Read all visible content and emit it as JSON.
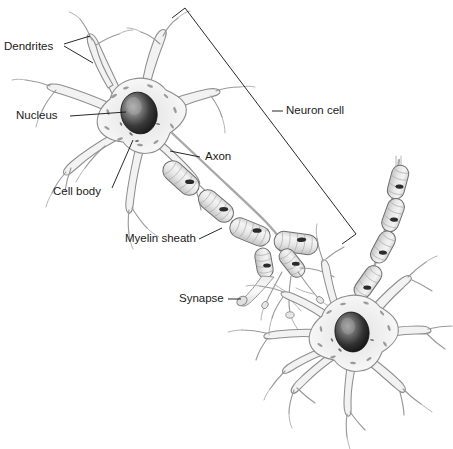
{
  "figure": {
    "background_color": "#ffffff",
    "width": 453,
    "height": 449,
    "style": "grayscale pencil/airbrush scientific illustration"
  },
  "labels": {
    "dendrites": "Dendrites",
    "nucleus": "Nucleus",
    "cell_body": "Cell body",
    "axon": "Axon",
    "myelin_sheath": "Myelin sheath",
    "synapse": "Synapse",
    "neuron_cell": "Neuron cell"
  },
  "label_positions": {
    "dendrites": {
      "x": 4,
      "y": 47,
      "anchor": "start"
    },
    "nucleus": {
      "x": 16,
      "y": 116,
      "anchor": "start"
    },
    "cell_body": {
      "x": 53,
      "y": 192,
      "anchor": "start"
    },
    "axon": {
      "x": 205,
      "y": 157,
      "anchor": "start"
    },
    "myelin_sheath": {
      "x": 125,
      "y": 239,
      "anchor": "start"
    },
    "synapse": {
      "x": 179,
      "y": 299,
      "anchor": "start"
    },
    "neuron_cell": {
      "x": 286,
      "y": 111,
      "anchor": "start"
    }
  },
  "colors": {
    "outline": "#8e8e8e",
    "cytoplasm": "#f2f2f2",
    "nucleus_dark": "#232323",
    "nucleus_highlight": "#b9b9b9",
    "leader_line": "#111111",
    "text": "#1a1a1a",
    "myelin_fill": "#e8e8e8",
    "myelin_outline": "#6f6f6f"
  },
  "parts": {
    "neuron_count": 2,
    "presynaptic_neuron": {
      "name": "upper-left neuron",
      "soma_center": {
        "x": 133,
        "y": 117
      },
      "nucleus_center": {
        "x": 139,
        "y": 114
      },
      "dendrite_count": 8
    },
    "postsynaptic_neuron": {
      "name": "lower-right neuron",
      "soma_center": {
        "x": 348,
        "y": 334
      },
      "nucleus_center": {
        "x": 351,
        "y": 332
      },
      "dendrite_count": 9
    },
    "axon": {
      "description": "axon extends from upper-left soma down-right to terminal branches",
      "myelin_segment_count_main": 6,
      "myelin_segment_count_terminal": 4,
      "myelin_segment_count_right_chain": 4
    },
    "synapse": {
      "description": "axon terminal bouton contacting dendrite of lower-right neuron",
      "point": {
        "x": 240,
        "y": 299
      }
    }
  },
  "bracket": {
    "description": "angled bracket spanning the upper-left neuron cell",
    "apex": {
      "x": 185,
      "y": 8
    },
    "left_end": {
      "x": 172,
      "y": 18
    },
    "bottom_corner": {
      "x": 356,
      "y": 234
    },
    "bottom_end": {
      "x": 342,
      "y": 244
    },
    "tick": {
      "x": 272,
      "y": 111
    }
  }
}
